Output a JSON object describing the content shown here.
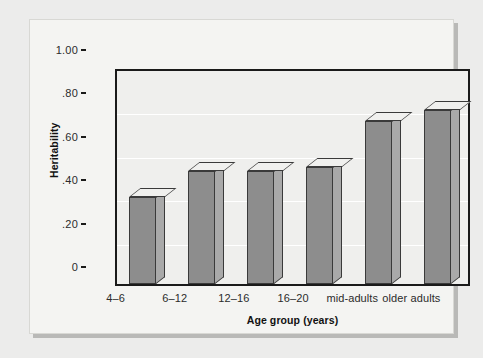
{
  "chart_data": {
    "type": "bar",
    "title": "",
    "xlabel": "Age group (years)",
    "ylabel": "Heritability",
    "categories": [
      "4–6",
      "6–12",
      "12–16",
      "16–20",
      "mid-adults",
      "older adults"
    ],
    "values": [
      0.4,
      0.52,
      0.52,
      0.54,
      0.75,
      0.8
    ],
    "ylim": [
      0,
      1.0
    ],
    "ytick_values": [
      1.0,
      0.8,
      0.6,
      0.4,
      0.2,
      0
    ],
    "ytick_labels": [
      "1.00",
      ".80",
      ".60",
      ".40",
      ".20",
      "0"
    ],
    "grid": true,
    "legend": false,
    "legend_position": "none",
    "style": "3d-bars-grayscale"
  },
  "colors": {
    "page_background": "#ececeb",
    "card_background": "#f4f4f2",
    "card_shadow": "#b9b9b7",
    "plot_background": "#efefed",
    "axis_line": "#1a1a1a",
    "gridline": "#ffffff",
    "bar_front": "#8d8d8d",
    "bar_side": "#a9a9a9",
    "bar_top": "#f0f0ee",
    "bar_outline": "#3a3a3a",
    "tick_label": "#2b2b2b",
    "axis_title": "#111111"
  }
}
